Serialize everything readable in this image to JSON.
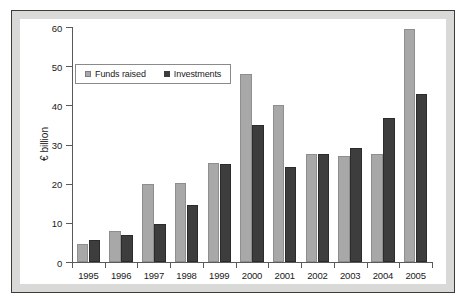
{
  "chart_data": {
    "type": "bar",
    "title": "",
    "xlabel": "",
    "ylabel": "€ billion",
    "ylim": [
      0,
      60
    ],
    "yticks": [
      0,
      10,
      20,
      30,
      40,
      50,
      60
    ],
    "grid": false,
    "legend_position": "top-left",
    "categories": [
      "1995",
      "1996",
      "1997",
      "1998",
      "1999",
      "2000",
      "2001",
      "2002",
      "2003",
      "2004",
      "2005"
    ],
    "series": [
      {
        "name": "Funds raised",
        "color": "#a8a8a8",
        "values": [
          4.5,
          8.0,
          20.0,
          20.3,
          25.3,
          48.0,
          40.0,
          27.5,
          27.0,
          27.5,
          59.5
        ]
      },
      {
        "name": "Investments",
        "color": "#3d3d3d",
        "values": [
          5.5,
          7.0,
          9.8,
          14.5,
          25.0,
          35.0,
          24.2,
          27.7,
          29.2,
          36.8,
          42.8
        ]
      }
    ]
  },
  "legend": {
    "items": [
      {
        "label": "Funds raised",
        "swatch": "funds"
      },
      {
        "label": "Investments",
        "swatch": "inv"
      }
    ]
  }
}
